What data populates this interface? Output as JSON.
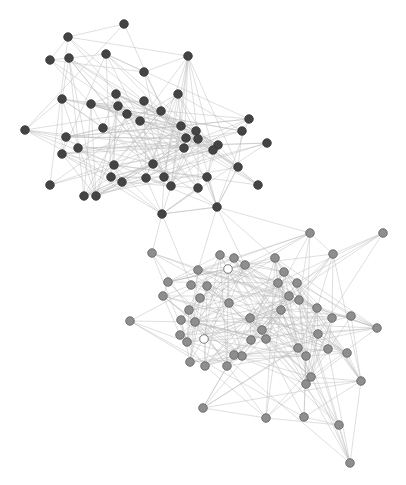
{
  "colors": {
    "background": "#ffffff",
    "edge": "#b8b8b8",
    "cluster_a_fill": "#444444",
    "cluster_a_stroke": "#333333",
    "cluster_b_fill": "#8e8e8e",
    "cluster_b_stroke": "#5e5e5e",
    "highlight_fill": "#ffffff",
    "highlight_stroke": "#5e5e5e"
  },
  "node_radius": 4.3,
  "clusters": [
    {
      "name": "cluster-a",
      "nodes": [
        [
          124,
          24
        ],
        [
          68,
          37
        ],
        [
          106,
          54
        ],
        [
          50,
          60
        ],
        [
          69,
          58
        ],
        [
          188,
          56
        ],
        [
          144,
          72
        ],
        [
          178,
          94
        ],
        [
          62,
          99
        ],
        [
          91,
          104
        ],
        [
          116,
          94
        ],
        [
          144,
          101
        ],
        [
          118,
          106
        ],
        [
          127,
          114
        ],
        [
          161,
          111
        ],
        [
          103,
          128
        ],
        [
          140,
          121
        ],
        [
          249,
          119
        ],
        [
          25,
          130
        ],
        [
          66,
          137
        ],
        [
          181,
          126
        ],
        [
          196,
          131
        ],
        [
          186,
          138
        ],
        [
          198,
          139
        ],
        [
          242,
          131
        ],
        [
          218,
          145
        ],
        [
          213,
          150
        ],
        [
          184,
          148
        ],
        [
          267,
          143
        ],
        [
          78,
          148
        ],
        [
          62,
          154
        ],
        [
          114,
          165
        ],
        [
          153,
          164
        ],
        [
          164,
          177
        ],
        [
          111,
          177
        ],
        [
          122,
          182
        ],
        [
          146,
          178
        ],
        [
          171,
          186
        ],
        [
          207,
          177
        ],
        [
          238,
          167
        ],
        [
          50,
          185
        ],
        [
          84,
          196
        ],
        [
          96,
          196
        ],
        [
          198,
          188
        ],
        [
          258,
          185
        ],
        [
          162,
          214
        ],
        [
          217,
          207
        ]
      ]
    },
    {
      "name": "cluster-b",
      "nodes": [
        [
          310,
          233
        ],
        [
          383,
          233
        ],
        [
          152,
          253
        ],
        [
          220,
          255
        ],
        [
          234,
          258
        ],
        [
          333,
          254
        ],
        [
          275,
          258
        ],
        [
          245,
          265
        ],
        [
          284,
          272
        ],
        [
          198,
          270
        ],
        [
          168,
          282
        ],
        [
          191,
          285
        ],
        [
          207,
          286
        ],
        [
          297,
          283
        ],
        [
          278,
          283
        ],
        [
          163,
          296
        ],
        [
          200,
          298
        ],
        [
          289,
          296
        ],
        [
          299,
          300
        ],
        [
          229,
          303
        ],
        [
          250,
          318
        ],
        [
          281,
          310
        ],
        [
          317,
          308
        ],
        [
          189,
          310
        ],
        [
          130,
          321
        ],
        [
          181,
          320
        ],
        [
          195,
          322
        ],
        [
          332,
          318
        ],
        [
          351,
          316
        ],
        [
          377,
          328
        ],
        [
          262,
          330
        ],
        [
          180,
          335
        ],
        [
          318,
          334
        ],
        [
          187,
          342
        ],
        [
          266,
          339
        ],
        [
          251,
          340
        ],
        [
          298,
          348
        ],
        [
          328,
          349
        ],
        [
          347,
          353
        ],
        [
          242,
          356
        ],
        [
          234,
          355
        ],
        [
          306,
          356
        ],
        [
          190,
          362
        ],
        [
          205,
          366
        ],
        [
          227,
          366
        ],
        [
          311,
          377
        ],
        [
          306,
          384
        ],
        [
          361,
          381
        ],
        [
          203,
          408
        ],
        [
          266,
          418
        ],
        [
          304,
          417
        ],
        [
          339,
          425
        ],
        [
          350,
          463
        ]
      ],
      "highlighted": [
        [
          228,
          269
        ],
        [
          204,
          339
        ]
      ]
    }
  ],
  "bridge_edges": [
    [
      162,
      214,
      198,
      188
    ],
    [
      162,
      214,
      146,
      178
    ],
    [
      217,
      207,
      207,
      177
    ],
    [
      217,
      207,
      238,
      167
    ],
    [
      162,
      214,
      217,
      207
    ],
    [
      162,
      214,
      152,
      253
    ],
    [
      162,
      214,
      191,
      285
    ],
    [
      217,
      207,
      275,
      258
    ],
    [
      217,
      207,
      310,
      233
    ],
    [
      217,
      207,
      245,
      265
    ],
    [
      217,
      207,
      198,
      270
    ]
  ],
  "edge_density": 0.18,
  "seed": 7
}
